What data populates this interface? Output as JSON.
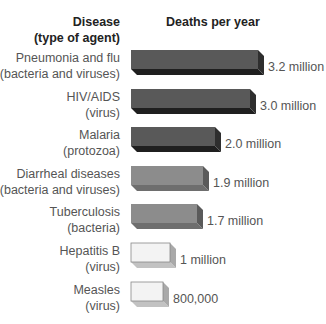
{
  "chart_data": {
    "type": "bar",
    "orientation": "horizontal",
    "style": "3d",
    "title": "",
    "xlabel": "Deaths per year",
    "ylabel": "Disease (type of agent)",
    "categories": [
      "Pneumonia and flu (bacteria and viruses)",
      "HIV/AIDS (virus)",
      "Malaria (protozoa)",
      "Diarrheal diseases (bacteria and viruses)",
      "Tuberculosis (bacteria)",
      "Hepatitis B (virus)",
      "Measles (virus)"
    ],
    "values": [
      3200000,
      3000000,
      2000000,
      1900000,
      1700000,
      1000000,
      800000
    ],
    "value_labels": [
      "3.2 million",
      "3.0 million",
      "2.0 million",
      "1.9 million",
      "1.7 million",
      "1 million",
      "800,000"
    ],
    "grid": false,
    "legend": null
  },
  "headers": {
    "disease": "Disease",
    "agent": "(type of agent)",
    "deaths": "Deaths per year"
  },
  "rows": [
    {
      "name": "Pneumonia and flu",
      "agent": "(bacteria and viruses)",
      "value_label": "3.2 million",
      "width": 127,
      "shade": "dark"
    },
    {
      "name": "HIV/AIDS",
      "agent": "(virus)",
      "value_label": "3.0 million",
      "width": 119,
      "shade": "dark"
    },
    {
      "name": "Malaria",
      "agent": "(protozoa)",
      "value_label": "2.0 million",
      "width": 84,
      "shade": "dark"
    },
    {
      "name": "Diarrheal diseases",
      "agent": "(bacteria and viruses)",
      "value_label": "1.9 million",
      "width": 72,
      "shade": "medium"
    },
    {
      "name": "Tuberculosis",
      "agent": "(bacteria)",
      "value_label": "1.7 million",
      "width": 66,
      "shade": "medium"
    },
    {
      "name": "Hepatitis B",
      "agent": "(virus)",
      "value_label": "1 million",
      "width": 39,
      "shade": "light"
    },
    {
      "name": "Measles",
      "agent": "(virus)",
      "value_label": "800,000",
      "width": 32,
      "shade": "light"
    }
  ],
  "colors": {
    "dark": {
      "front": "#595959",
      "side": "#2e2e2e",
      "bottom": "#1f1f1f"
    },
    "medium": {
      "front": "#8c8c8c",
      "side": "#5a5a5a",
      "bottom": "#6e6e6e"
    },
    "light": {
      "front": "#f3f3f3",
      "side": "#a9a9a9",
      "bottom": "#c2c2c2"
    }
  },
  "caption": "Figure"
}
